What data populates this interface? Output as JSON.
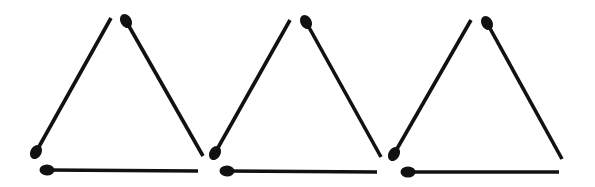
{
  "puzzle": {
    "type": "matchstick-arrangement",
    "background": "#ffffff",
    "stick_color": "#111111",
    "triangles": [
      {
        "id": "triangle-1",
        "sticks": [
          {
            "side": "left",
            "head": [
              36,
              152
            ],
            "tail": [
              111,
              18
            ]
          },
          {
            "side": "right",
            "head": [
              126,
              21
            ],
            "tail": [
              203,
              156
            ]
          },
          {
            "side": "bottom",
            "head": [
              47,
              170
            ],
            "tail": [
              198,
              171
            ]
          }
        ]
      },
      {
        "id": "triangle-2",
        "sticks": [
          {
            "side": "left",
            "head": [
              215,
              153
            ],
            "tail": [
              290,
              20
            ]
          },
          {
            "side": "right",
            "head": [
              306,
              22
            ],
            "tail": [
              381,
              157
            ]
          },
          {
            "side": "bottom",
            "head": [
              227,
              171
            ],
            "tail": [
              377,
              172
            ]
          }
        ]
      },
      {
        "id": "triangle-3",
        "sticks": [
          {
            "side": "left",
            "head": [
              394,
              154
            ],
            "tail": [
              471,
              20
            ]
          },
          {
            "side": "right",
            "head": [
              487,
              23
            ],
            "tail": [
              562,
              159
            ]
          },
          {
            "side": "bottom",
            "head": [
              408,
              172
            ],
            "tail": [
              559,
              172
            ]
          }
        ]
      }
    ]
  }
}
